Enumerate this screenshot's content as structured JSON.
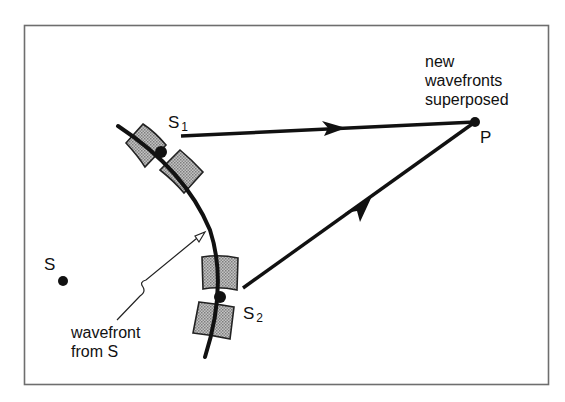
{
  "diagram": {
    "type": "wave-interference (Huygens secondary sources)",
    "labels": {
      "source": "S",
      "s1_main": "S",
      "s1_sub": "1",
      "s2_main": "S",
      "s2_sub": "2",
      "point": "P",
      "note_line1": "new",
      "note_line2": "wavefronts",
      "note_line3": "superposed",
      "wavefront_line1": "wavefront",
      "wavefront_line2": "from S"
    },
    "points": {
      "S": [
        63,
        281
      ],
      "S1": [
        161,
        152
      ],
      "S2": [
        220,
        297
      ],
      "P": [
        475,
        122
      ]
    },
    "colors": {
      "ink": "#111111",
      "shade": "#9a9a9a",
      "frame": "#6e6e6e"
    }
  }
}
